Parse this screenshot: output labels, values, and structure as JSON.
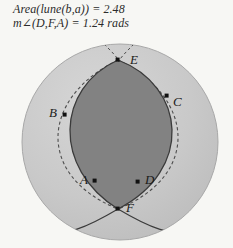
{
  "canvas": {
    "width": 233,
    "height": 248,
    "background_color": "#f7f7f4"
  },
  "measurements": {
    "area_line": "Area(lune(b,a)) = 2.48",
    "angle_line": "m∠(D,F,A) = 1.24 rads"
  },
  "figure": {
    "type": "sphere-with-lune",
    "sphere": {
      "center_x": 120,
      "center_y": 142,
      "radius": 98,
      "fill_color": "#c9c9c9",
      "edge_color": "#9a9a9a"
    },
    "lune": {
      "label": "lune(b,a)",
      "fill_color": "#828282",
      "stroke_color": "#3a3a3a",
      "apex_top": "E",
      "apex_bottom": "F"
    },
    "dashed_arcs_color": "#4a4a4a",
    "point_color": "#111111"
  },
  "points": [
    {
      "label": "B",
      "x": 65,
      "y": 115,
      "label_x": 49,
      "label_y": 112
    },
    {
      "label": "E",
      "x": 118,
      "y": 60,
      "label_x": 130,
      "label_y": 59
    },
    {
      "label": "C",
      "x": 167,
      "y": 96,
      "label_x": 173,
      "label_y": 100
    },
    {
      "label": "A",
      "x": 95,
      "y": 181,
      "label_x": 80,
      "label_y": 178
    },
    {
      "label": "D",
      "x": 138,
      "y": 182,
      "label_x": 145,
      "label_y": 178
    },
    {
      "label": "F",
      "x": 118,
      "y": 209,
      "label_x": 126,
      "label_y": 206
    }
  ]
}
